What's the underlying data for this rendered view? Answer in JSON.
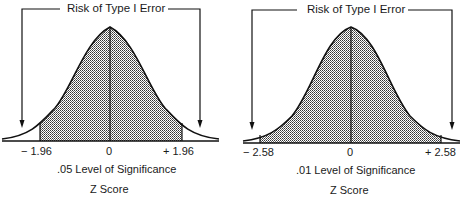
{
  "panels": [
    {
      "title": "Risk of Type I Error",
      "tick_left": "− 1.96",
      "tick_center": "0",
      "tick_right": "+ 1.96",
      "caption": ".05 Level of Significance",
      "axis_label": "Z Score"
    },
    {
      "title": "Risk of Type I Error",
      "tick_left": "− 2.58",
      "tick_center": "0",
      "tick_right": "+ 2.58",
      "caption": ".01 Level of Significance",
      "axis_label": "Z Score"
    }
  ],
  "colors": {
    "line": "#111111",
    "shade": "#555555",
    "background": "#ffffff"
  }
}
